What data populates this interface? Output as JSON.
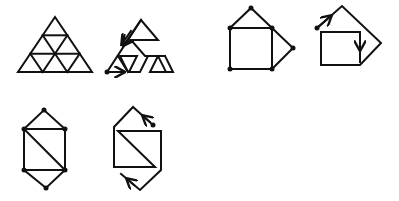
{
  "colors": {
    "stroke": "#111111",
    "background": "#ffffff"
  },
  "figures": [
    {
      "id": "triangle-grid",
      "description": "Large triangle subdivided into 9 small triangles"
    },
    {
      "id": "triangle-path",
      "description": "Single-stroke tracing path of triangle grid with start dot and direction arrows"
    },
    {
      "id": "house-graph",
      "description": "Square with triangle roof on top and triangle on right side, vertices marked with dots"
    },
    {
      "id": "house-path",
      "description": "Single-stroke tracing path of house graph with start dot and direction arrows"
    },
    {
      "id": "hexagon-graph",
      "description": "Square with diagonal and triangles on top and bottom, vertices marked with dots"
    },
    {
      "id": "hexagon-path",
      "description": "Single-stroke tracing path of hexagon graph with start dot and direction arrows"
    }
  ]
}
